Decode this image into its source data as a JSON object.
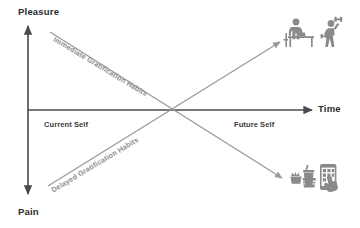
{
  "diagram": {
    "axes": {
      "y_top_label": "Pleasure",
      "y_bottom_label": "Pain",
      "x_right_label": "Time",
      "origin_left_label": "Current Self",
      "origin_right_label": "Future Self"
    },
    "lines": [
      {
        "name": "immediate-gratification",
        "label": "Immediate Gratification Habits",
        "direction": "down-right",
        "from": "upper-left (Pleasure now)",
        "to": "lower-right (Pain later)",
        "endpoint_icon": "fast-food-and-smartphone-icon"
      },
      {
        "name": "delayed-gratification",
        "label": "Delayed Gratification Habits",
        "direction": "up-right",
        "from": "lower-left (Pain now)",
        "to": "upper-right (Pleasure later)",
        "endpoint_icon": "desk-work-and-exercise-icon"
      }
    ],
    "icons": {
      "top_right": {
        "name": "desk-work-and-exercise-icon",
        "description": "Person working at a desk and person lifting a dumbbell"
      },
      "bottom_right": {
        "name": "fast-food-and-smartphone-icon",
        "description": "Fast food burger, fries and drink beside a hand tapping a smartphone"
      }
    },
    "colors": {
      "axis": "#4a4a4a",
      "diagonal": "#9a9a9a",
      "icon": "#8a8a8a",
      "text_dark": "#2b2b2b",
      "text_muted": "#8d8d8d",
      "background": "#ffffff"
    }
  }
}
